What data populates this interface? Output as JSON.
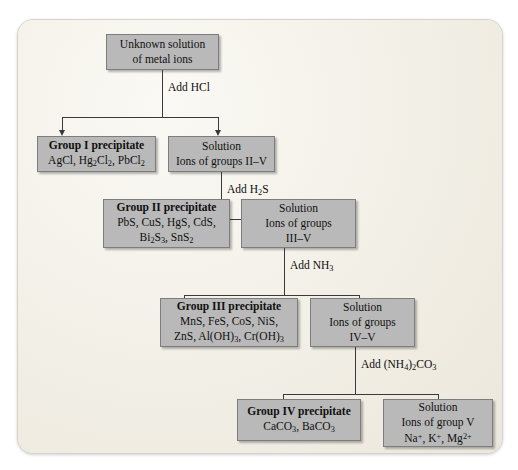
{
  "diagram": {
    "panel_color": "#f4f1ea",
    "box_color": "#b9b9b9",
    "box_border_color": "#7d7d7d",
    "line_color": "#3a3a3a"
  },
  "nodes": {
    "start": {
      "line1": "Unknown solution",
      "line2": "of metal ions"
    },
    "group1_precipitate": {
      "header": "Group I precipitate",
      "line1": "AgCl, Hg2Cl2, PbCl2"
    },
    "solution_2_5": {
      "line1": "Solution",
      "line2": "Ions of groups II–V"
    },
    "group2_precipitate": {
      "header": "Group II precipitate",
      "line1": "PbS, CuS, HgS, CdS,",
      "line2": "Bi2S3, SnS2"
    },
    "solution_3_5": {
      "line1": "Solution",
      "line2": "Ions of groups",
      "line3": "III–V"
    },
    "group3_precipitate": {
      "header": "Group III precipitate",
      "line1": "MnS, FeS, CoS, NiS,",
      "line2": "ZnS, Al(OH)3, Cr(OH)3"
    },
    "solution_4_5": {
      "line1": "Solution",
      "line2": "Ions of groups",
      "line3": "IV–V"
    },
    "group4_precipitate": {
      "header": "Group IV precipitate",
      "line1": "CaCO3, BaCO3"
    },
    "solution_5": {
      "line1": "Solution",
      "line2": "Ions of group V",
      "line3": "Na+, K+, Mg2+"
    }
  },
  "reagents": {
    "step1": "Add HCl",
    "step2": "Add H2S",
    "step3": "Add NH3",
    "step4": "Add (NH4)2CO3"
  }
}
